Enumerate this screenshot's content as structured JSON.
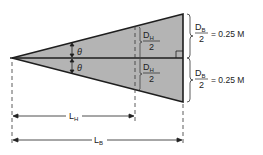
{
  "diagram": {
    "colors": {
      "fill": "#b4b4b4",
      "stroke": "#1e1e1e",
      "background": "#ffffff"
    },
    "angle_top": {
      "symbol": "θ"
    },
    "angle_bottom": {
      "symbol": "θ"
    },
    "half_height_top": {
      "num": "D",
      "num_sub": "H",
      "den": "2"
    },
    "half_height_bottom": {
      "num": "D",
      "num_sub": "H",
      "den": "2"
    },
    "half_base_top": {
      "num": "D",
      "num_sub": "B",
      "den": "2",
      "value": "= 0.25 M"
    },
    "half_base_bottom": {
      "num": "D",
      "num_sub": "B",
      "den": "2",
      "value": "= 0.25 M"
    },
    "length_h": {
      "main": "L",
      "sub": "H"
    },
    "length_b": {
      "main": "L",
      "sub": "B"
    }
  }
}
